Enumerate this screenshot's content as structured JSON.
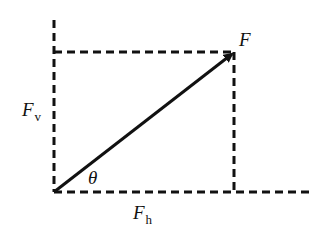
{
  "diagram": {
    "type": "force-vector-decomposition",
    "colors": {
      "line": "#111111",
      "background": "#ffffff"
    },
    "labels": {
      "force": "F",
      "vertical_main": "F",
      "vertical_sub": "v",
      "horizontal_main": "F",
      "horizontal_sub": "h",
      "angle": "θ"
    },
    "elements": {
      "vector_arrow": {
        "from": [
          54,
          192
        ],
        "to": [
          234,
          52
        ]
      },
      "vertical_axis_dashed": {
        "x": 54,
        "y1": 20,
        "y2": 192
      },
      "horizontal_axis_dashed": {
        "y": 192,
        "x1": 54,
        "x2": 312
      },
      "top_projection_dashed": {
        "y": 52,
        "x1": 54,
        "x2": 234
      },
      "right_projection_dashed": {
        "x": 234,
        "y1": 52,
        "y2": 192
      }
    }
  }
}
